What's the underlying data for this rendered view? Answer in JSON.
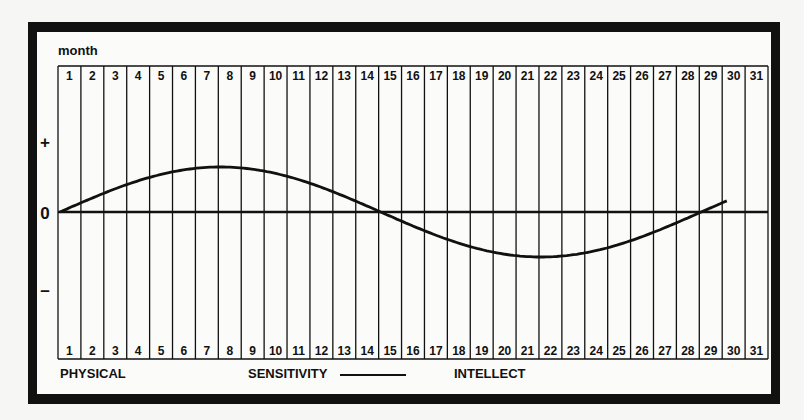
{
  "chart_data": {
    "type": "line",
    "title": "",
    "xlabel": "month",
    "ylabel": "",
    "categories": [
      1,
      2,
      3,
      4,
      5,
      6,
      7,
      8,
      9,
      10,
      11,
      12,
      13,
      14,
      15,
      16,
      17,
      18,
      19,
      20,
      21,
      22,
      23,
      24,
      25,
      26,
      27,
      28,
      29,
      30,
      31
    ],
    "y_ticks": [
      "+",
      "0",
      "–"
    ],
    "grid": true,
    "series": [
      {
        "name": "SENSITIVITY",
        "x": [
          1,
          2,
          3,
          4,
          5,
          6,
          7,
          8,
          9,
          10,
          11,
          12,
          13,
          14,
          15,
          16,
          17,
          18,
          19,
          20,
          21,
          22,
          23,
          24,
          25,
          26,
          27,
          28,
          29,
          30
        ],
        "values": [
          0,
          0.22,
          0.43,
          0.62,
          0.78,
          0.9,
          0.97,
          1.0,
          0.97,
          0.9,
          0.78,
          0.62,
          0.43,
          0.22,
          0,
          -0.22,
          -0.43,
          -0.62,
          -0.78,
          -0.9,
          -0.97,
          -1.0,
          -0.97,
          -0.9,
          -0.78,
          -0.62,
          -0.43,
          -0.22,
          0,
          0.22
        ]
      }
    ],
    "legend": [
      "PHYSICAL",
      "SENSITIVITY",
      "INTELLECT"
    ],
    "period_days": 28,
    "ylim": [
      -2,
      2
    ]
  },
  "labels": {
    "month": "month",
    "plus": "+",
    "zero": "0",
    "minus": "–",
    "physical": "PHYSICAL",
    "sensitivity": "SENSITIVITY",
    "intellect": "INTELLECT"
  }
}
